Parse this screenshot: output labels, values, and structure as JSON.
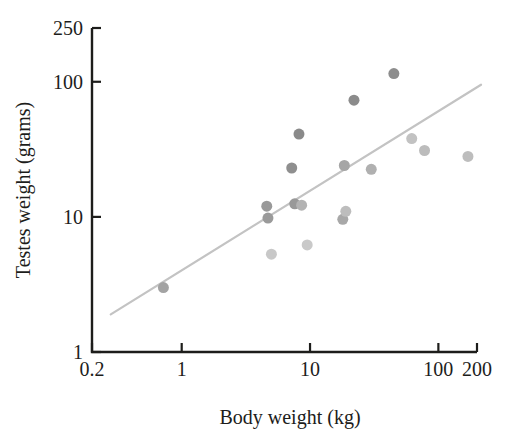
{
  "chart_data": {
    "type": "scatter",
    "title": "",
    "xlabel": "Body weight (kg)",
    "ylabel": "Testes weight (grams)",
    "xscale": "log",
    "yscale": "log",
    "xlim": [
      0.2,
      200
    ],
    "ylim": [
      1,
      250
    ],
    "grid": false,
    "legend": null,
    "xticks": [
      {
        "value": 0.2,
        "label": "0.2"
      },
      {
        "value": 1,
        "label": "1"
      },
      {
        "value": 10,
        "label": "10"
      },
      {
        "value": 100,
        "label": "100"
      },
      {
        "value": 200,
        "label": "200"
      }
    ],
    "yticks": [
      {
        "value": 1,
        "label": "1"
      },
      {
        "value": 10,
        "label": "10"
      },
      {
        "value": 100,
        "label": "100"
      },
      {
        "value": 250,
        "label": "250"
      }
    ],
    "series": [
      {
        "name": "primate species",
        "marker": "circle",
        "marker_size": 11,
        "points": [
          {
            "x": 0.72,
            "y": 3.0,
            "color": "#a3a3a3"
          },
          {
            "x": 4.6,
            "y": 12.0,
            "color": "#999999"
          },
          {
            "x": 4.7,
            "y": 9.8,
            "color": "#9a9a9a"
          },
          {
            "x": 5.0,
            "y": 5.3,
            "color": "#c8c8c8"
          },
          {
            "x": 7.2,
            "y": 23.0,
            "color": "#8f8f8f"
          },
          {
            "x": 7.6,
            "y": 12.5,
            "color": "#999999"
          },
          {
            "x": 8.2,
            "y": 41.0,
            "color": "#8a8a8a"
          },
          {
            "x": 8.6,
            "y": 12.2,
            "color": "#b3b3b3"
          },
          {
            "x": 9.5,
            "y": 6.2,
            "color": "#c9c9c9"
          },
          {
            "x": 18.0,
            "y": 9.6,
            "color": "#a8a8a8"
          },
          {
            "x": 18.5,
            "y": 24.0,
            "color": "#a6a6a6"
          },
          {
            "x": 19.0,
            "y": 11.0,
            "color": "#bdbdbd"
          },
          {
            "x": 22.0,
            "y": 73.0,
            "color": "#8b8b8b"
          },
          {
            "x": 30.0,
            "y": 22.5,
            "color": "#b0b0b0"
          },
          {
            "x": 45.0,
            "y": 115.0,
            "color": "#8d8d8d"
          },
          {
            "x": 62.0,
            "y": 38.0,
            "color": "#c2c2c2"
          },
          {
            "x": 78.0,
            "y": 31.0,
            "color": "#bcbcbc"
          },
          {
            "x": 170.0,
            "y": 28.0,
            "color": "#bdbdbd"
          }
        ]
      }
    ],
    "trend_line": {
      "type": "linear-on-log-log",
      "color": "#c3c3c3",
      "width": 2.2,
      "x_start": 0.28,
      "y_start": 1.9,
      "x_end": 215,
      "y_end": 95
    },
    "colors": {
      "axis": "#1d1d1b",
      "point_dark": "#8b8b8b",
      "point_light": "#c8c8c8",
      "trend": "#c3c3c3",
      "background": "#ffffff"
    }
  }
}
